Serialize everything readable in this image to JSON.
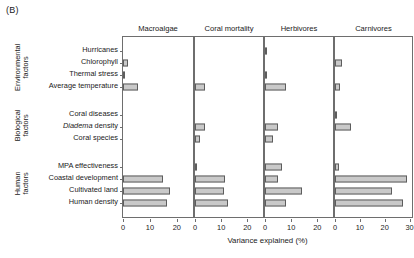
{
  "figure": {
    "panel_letter": "(B)",
    "xaxis_title": "Variance explained (%)",
    "group_labels": [
      {
        "id": "environmental",
        "lines": [
          "Environmental",
          "factors"
        ]
      },
      {
        "id": "biological",
        "lines": [
          "Biological",
          "factors"
        ]
      },
      {
        "id": "human",
        "lines": [
          "Human",
          "factors"
        ]
      }
    ]
  },
  "chart_data": {
    "type": "bar",
    "orientation": "horizontal",
    "title": "(B)",
    "xlabel": "Variance explained (%)",
    "ylabel": "",
    "grid": false,
    "legend": "none",
    "bar_color": "#c9c9c9",
    "bar_edge_color": "#5d5d5d",
    "categories": [
      "Hurricanes",
      "Chlorophyll",
      "Thermal stress",
      "Average temperature",
      "Coral diseases",
      "Diadema density",
      "Coral species",
      "MPA effectiveness",
      "Coastal development",
      "Cultivated land",
      "Human density"
    ],
    "category_groups": [
      {
        "name": "Environmental factors",
        "categories": [
          "Hurricanes",
          "Chlorophyll",
          "Thermal stress",
          "Average temperature"
        ]
      },
      {
        "name": "Biological factors",
        "categories": [
          "Coral diseases",
          "Diadema density",
          "Coral species"
        ]
      },
      {
        "name": "Human factors",
        "categories": [
          "MPA effectiveness",
          "Coastal development",
          "Cultivated land",
          "Human density"
        ]
      }
    ],
    "panels": [
      {
        "name": "Macroalgae",
        "xlim": [
          0,
          26
        ],
        "xticks": [
          0,
          10,
          20
        ],
        "xticklabels": [
          "0",
          "10",
          "20"
        ],
        "values": [
          0.0,
          2.0,
          0.4,
          5.5,
          0.0,
          0.0,
          0.0,
          0.0,
          15.0,
          17.5,
          16.5
        ]
      },
      {
        "name": "Coral mortality",
        "xlim": [
          0,
          26
        ],
        "xticks": [
          0,
          10,
          20
        ],
        "xticklabels": [
          "0",
          "10",
          "20"
        ],
        "values": [
          0.0,
          0.0,
          0.0,
          4.0,
          0.0,
          4.0,
          2.0,
          0.4,
          11.5,
          11.0,
          12.5
        ]
      },
      {
        "name": "Herbivores",
        "xlim": [
          0,
          26
        ],
        "xticks": [
          0,
          10,
          20
        ],
        "xticklabels": [
          "0",
          "10",
          "20"
        ],
        "values": [
          0.8,
          0.0,
          0.8,
          8.0,
          0.0,
          5.0,
          3.0,
          6.5,
          5.0,
          14.0,
          8.0
        ]
      },
      {
        "name": "Carnivores",
        "xlim": [
          0,
          31
        ],
        "xticks": [
          0,
          10,
          20,
          30
        ],
        "xticklabels": [
          "0",
          "10",
          "20",
          "30"
        ],
        "values": [
          0.0,
          3.0,
          0.0,
          2.0,
          0.8,
          6.5,
          0.0,
          1.5,
          29.0,
          23.0,
          27.5
        ]
      }
    ]
  }
}
